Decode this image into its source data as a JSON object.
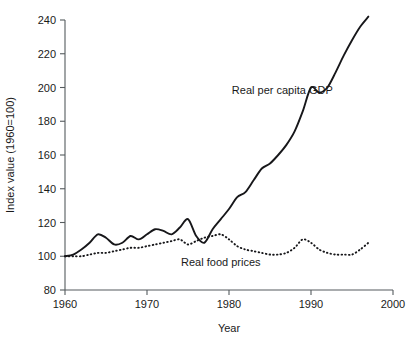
{
  "chart_data": {
    "type": "line",
    "title": "",
    "xlabel": "Year",
    "ylabel": "Index value (1960=100)",
    "xlim": [
      1960,
      2000
    ],
    "ylim": [
      80,
      240
    ],
    "xticks": [
      1960,
      1970,
      1980,
      1990,
      2000
    ],
    "yticks": [
      80,
      100,
      120,
      140,
      160,
      180,
      200,
      220,
      240
    ],
    "xtick_labels": [
      "1960",
      "1970",
      "1980",
      "1990",
      "2000"
    ],
    "ytick_labels": [
      "80",
      "100",
      "120",
      "140",
      "160",
      "180",
      "200",
      "220",
      "240"
    ],
    "grid": false,
    "legend": "inline-annotations",
    "frame": "left-bottom-spines-only",
    "annotations": [
      {
        "name": "gdp-label",
        "text": "Real per capita GDP",
        "x": 1986.5,
        "y": 196
      },
      {
        "name": "food-label",
        "text": "Real food prices",
        "x": 1979.0,
        "y": 94
      }
    ],
    "series": [
      {
        "name": "Real per capita GDP",
        "style": "solid",
        "color": "#17171a",
        "x": [
          1960,
          1961,
          1962,
          1963,
          1964,
          1965,
          1966,
          1967,
          1968,
          1969,
          1970,
          1971,
          1972,
          1973,
          1974,
          1975,
          1976,
          1977,
          1978,
          1979,
          1980,
          1981,
          1982,
          1983,
          1984,
          1985,
          1986,
          1987,
          1988,
          1989,
          1990,
          1991,
          1992,
          1993,
          1994,
          1995,
          1996,
          1997
        ],
        "values": [
          100,
          101,
          104,
          108,
          113,
          111,
          107,
          108,
          112,
          110,
          113,
          116,
          115,
          113,
          117,
          122,
          112,
          108,
          116,
          122,
          128,
          135,
          138,
          145,
          152,
          155,
          160,
          166,
          174,
          186,
          200,
          197,
          200,
          209,
          219,
          228,
          236,
          242
        ]
      },
      {
        "name": "Real food prices",
        "style": "dotted",
        "color": "#17171a",
        "x": [
          1960,
          1961,
          1962,
          1963,
          1964,
          1965,
          1966,
          1967,
          1968,
          1969,
          1970,
          1971,
          1972,
          1973,
          1974,
          1975,
          1976,
          1977,
          1978,
          1979,
          1980,
          1981,
          1982,
          1983,
          1984,
          1985,
          1986,
          1987,
          1988,
          1989,
          1990,
          1991,
          1992,
          1993,
          1994,
          1995,
          1996,
          1997
        ],
        "values": [
          100,
          100,
          100,
          101,
          102,
          102,
          103,
          104,
          105,
          105,
          106,
          107,
          108,
          109,
          110,
          107,
          109,
          111,
          112,
          113,
          110,
          106,
          104,
          103,
          102,
          101,
          101,
          102,
          105,
          110,
          108,
          104,
          102,
          101,
          101,
          101,
          104,
          108
        ]
      }
    ]
  }
}
